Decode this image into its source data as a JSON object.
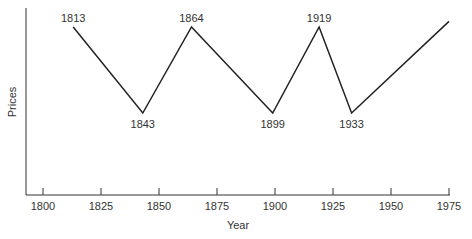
{
  "chart_data": {
    "type": "line",
    "title": "",
    "xlabel": "Year",
    "ylabel": "Prices",
    "xlim": [
      1793,
      1975
    ],
    "ylim": [
      0,
      10
    ],
    "grid": false,
    "legend": null,
    "x_ticks": [
      1800,
      1825,
      1850,
      1875,
      1900,
      1925,
      1950,
      1975
    ],
    "y_ticks": [],
    "series": [
      {
        "name": "Prices",
        "points": [
          {
            "x": 1813,
            "y": 9,
            "label": "1813",
            "label_pos": "above"
          },
          {
            "x": 1843,
            "y": 4.4,
            "label": "1843",
            "label_pos": "below"
          },
          {
            "x": 1864,
            "y": 9,
            "label": "1864",
            "label_pos": "above"
          },
          {
            "x": 1899,
            "y": 4.4,
            "label": "1899",
            "label_pos": "below"
          },
          {
            "x": 1919,
            "y": 9,
            "label": "1919",
            "label_pos": "above"
          },
          {
            "x": 1933,
            "y": 4.4,
            "label": "1933",
            "label_pos": "below"
          },
          {
            "x": 1975,
            "y": 9.3,
            "label": "",
            "label_pos": "none"
          }
        ]
      }
    ],
    "annotations": [
      "1813",
      "1843",
      "1864",
      "1899",
      "1919",
      "1933"
    ]
  },
  "colors": {
    "line": "#222222",
    "text": "#333333",
    "background": "#ffffff"
  }
}
